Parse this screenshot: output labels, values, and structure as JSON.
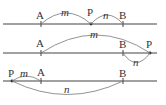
{
  "diagram": {
    "type": "number-line-point-positions",
    "panels": [
      {
        "id": "case-1",
        "description": "P between A and B",
        "points": [
          {
            "label": "A",
            "x": 41
          },
          {
            "label": "P",
            "x": 91
          },
          {
            "label": "B",
            "x": 123
          }
        ],
        "arcs": [
          {
            "from": "A",
            "to": "P",
            "label": "m",
            "side": "above"
          },
          {
            "from": "P",
            "to": "B",
            "label": "n",
            "side": "above"
          }
        ]
      },
      {
        "id": "case-2",
        "description": "P beyond B",
        "points": [
          {
            "label": "A",
            "x": 41
          },
          {
            "label": "B",
            "x": 123
          },
          {
            "label": "P",
            "x": 150
          }
        ],
        "arcs": [
          {
            "from": "A",
            "to": "P",
            "label": "m",
            "side": "above"
          },
          {
            "from": "B",
            "to": "P",
            "label": "n",
            "side": "below"
          }
        ]
      },
      {
        "id": "case-3",
        "description": "P before A",
        "points": [
          {
            "label": "P",
            "x": 12
          },
          {
            "label": "A",
            "x": 41
          },
          {
            "label": "B",
            "x": 123
          }
        ],
        "arcs": [
          {
            "from": "P",
            "to": "A",
            "label": "m",
            "side": "above"
          },
          {
            "from": "P",
            "to": "B",
            "label": "n",
            "side": "below"
          }
        ]
      }
    ]
  },
  "labels": {
    "p1": {
      "A": "A",
      "P": "P",
      "B": "B",
      "m": "m",
      "n": "n"
    },
    "p2": {
      "A": "A",
      "P": "P",
      "B": "B",
      "m": "m",
      "n": "n"
    },
    "p3": {
      "A": "A",
      "P": "P",
      "B": "B",
      "m": "m",
      "n": "n"
    }
  }
}
